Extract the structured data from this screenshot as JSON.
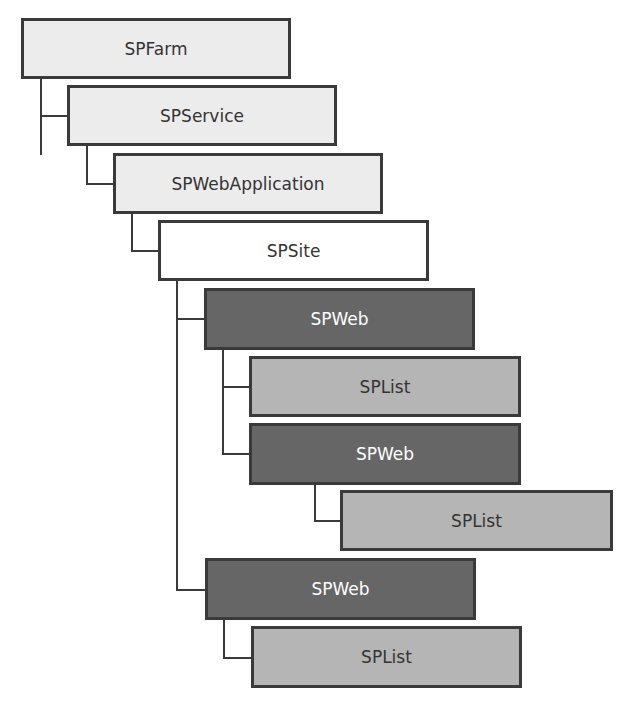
{
  "diagram": {
    "type": "object-hierarchy",
    "colors": {
      "light": "#ececec",
      "white": "#ffffff",
      "dark": "#666666",
      "medium": "#b5b5b5",
      "line": "#3a3a3a"
    },
    "nodes": [
      {
        "id": "spfarm",
        "label": "SPFarm",
        "level": 0,
        "style": "light"
      },
      {
        "id": "spservice",
        "label": "SPService",
        "level": 1,
        "style": "light",
        "parent": "spfarm"
      },
      {
        "id": "spwebapplication",
        "label": "SPWebApplication",
        "level": 2,
        "style": "light",
        "parent": "spservice"
      },
      {
        "id": "spsite",
        "label": "SPSite",
        "level": 3,
        "style": "white",
        "parent": "spwebapplication"
      },
      {
        "id": "spweb-1",
        "label": "SPWeb",
        "level": 4,
        "style": "dark",
        "parent": "spsite"
      },
      {
        "id": "splist-1",
        "label": "SPList",
        "level": 5,
        "style": "medium",
        "parent": "spweb-1"
      },
      {
        "id": "spweb-2",
        "label": "SPWeb",
        "level": 5,
        "style": "dark",
        "parent": "spweb-1"
      },
      {
        "id": "splist-2",
        "label": "SPList",
        "level": 6,
        "style": "medium",
        "parent": "spweb-2"
      },
      {
        "id": "spweb-3",
        "label": "SPWeb",
        "level": 4,
        "style": "dark",
        "parent": "spsite"
      },
      {
        "id": "splist-3",
        "label": "SPList",
        "level": 5,
        "style": "medium",
        "parent": "spweb-3"
      }
    ]
  }
}
